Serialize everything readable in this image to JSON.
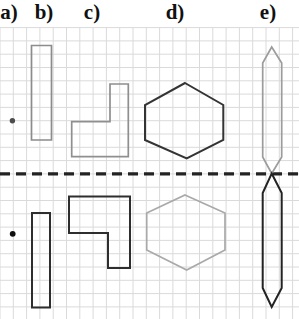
{
  "page": {
    "background_color": "#ffffff",
    "width": 299,
    "height": 319
  },
  "labels": [
    {
      "text": "a)"
    },
    {
      "text": "b)"
    },
    {
      "text": "c)"
    },
    {
      "text": "d)"
    },
    {
      "text": "e)"
    }
  ],
  "figure": {
    "grid": {
      "spacing": 13.3,
      "start_x": 0,
      "start_y": 27.6,
      "color": "#dadada",
      "stroke_width": 1
    },
    "mirror_line": {
      "y": 173.9,
      "color": "#232323",
      "stroke_width": 3.2,
      "dasharray": "10,6"
    },
    "colors": {
      "original_gray": "#919191",
      "reflection_dark": "#2e2e2e"
    },
    "shapes": [
      {
        "name": "point-a-original",
        "kind": "circle",
        "cx": 12.4,
        "cy": 120.8,
        "r": 2.7,
        "fill": "#4d4d4d"
      },
      {
        "name": "point-a-reflection",
        "kind": "circle",
        "cx": 12.7,
        "cy": 233.8,
        "r": 2.9,
        "fill": "#0f0f0f"
      },
      {
        "name": "rect-b-original",
        "kind": "polygon",
        "stroke": "#8c8c8c",
        "stroke_width": 1.7,
        "points": [
          [
            31.5,
            45.5
          ],
          [
            51.5,
            45.5
          ],
          [
            51.5,
            140
          ],
          [
            31.5,
            140
          ]
        ]
      },
      {
        "name": "rect-b-reflection",
        "kind": "polygon",
        "stroke": "#2e2e2e",
        "stroke_width": 2,
        "points": [
          [
            32,
            213
          ],
          [
            50,
            213
          ],
          [
            50,
            307.5
          ],
          [
            32,
            307.5
          ]
        ]
      },
      {
        "name": "l-shape-c-original",
        "kind": "polygon",
        "stroke": "#8f8f8f",
        "stroke_width": 1.7,
        "points": [
          [
            110,
            84
          ],
          [
            128.3,
            84
          ],
          [
            128.3,
            156.7
          ],
          [
            71.7,
            156.7
          ],
          [
            71.7,
            121.7
          ],
          [
            110,
            121.7
          ]
        ]
      },
      {
        "name": "l-shape-c-reflection",
        "kind": "polygon",
        "stroke": "#2e2e2e",
        "stroke_width": 2,
        "points": [
          [
            69,
            196.5
          ],
          [
            130,
            196.5
          ],
          [
            130,
            268
          ],
          [
            108,
            268
          ],
          [
            108,
            233
          ],
          [
            69,
            233
          ]
        ]
      },
      {
        "name": "hexagon-d-original",
        "kind": "polygon",
        "stroke": "#343434",
        "stroke_width": 2,
        "points": [
          [
            185,
            83
          ],
          [
            223.3,
            105
          ],
          [
            223.3,
            140
          ],
          [
            186.7,
            158.3
          ],
          [
            145,
            140
          ],
          [
            145,
            105
          ]
        ]
      },
      {
        "name": "hexagon-d-reflection",
        "kind": "polygon",
        "stroke": "#a9a9a9",
        "stroke_width": 1.7,
        "points": [
          [
            185,
            195
          ],
          [
            225,
            213
          ],
          [
            225,
            250
          ],
          [
            186.7,
            270
          ],
          [
            146.7,
            250
          ],
          [
            146.7,
            213
          ]
        ]
      },
      {
        "name": "spindle-e-original",
        "kind": "polygon",
        "stroke": "#9c9c9c",
        "stroke_width": 1.7,
        "points": [
          [
            271.7,
            47
          ],
          [
            281.7,
            63
          ],
          [
            281.7,
            157
          ],
          [
            271.7,
            173.5
          ],
          [
            262.7,
            157
          ],
          [
            262.7,
            63
          ]
        ]
      },
      {
        "name": "spindle-e-reflection",
        "kind": "polygon",
        "stroke": "#232323",
        "stroke_width": 2,
        "points": [
          [
            271.7,
            173.5
          ],
          [
            281.7,
            193
          ],
          [
            281.7,
            288
          ],
          [
            271.7,
            307
          ],
          [
            262.7,
            288
          ],
          [
            262.7,
            193
          ]
        ]
      }
    ]
  }
}
